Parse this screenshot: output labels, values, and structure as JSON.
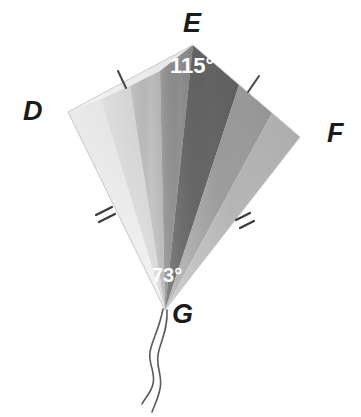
{
  "figure": {
    "background_color": "#ffffff",
    "vertices": [
      {
        "name": "D",
        "label": "D",
        "x": 68,
        "y": 112
      },
      {
        "name": "E",
        "label": "E",
        "x": 193,
        "y": 45
      },
      {
        "name": "F",
        "label": "F",
        "x": 300,
        "y": 137
      },
      {
        "name": "G",
        "label": "G",
        "x": 165,
        "y": 310
      }
    ],
    "angles": [
      {
        "name": "angle-at-E",
        "label": "115°",
        "value": 115,
        "at_vertex": "E",
        "text_color": "#ffffff"
      },
      {
        "name": "angle-at-G",
        "label": "73°",
        "value": 73,
        "at_vertex": "G",
        "text_color": "#ffffff"
      }
    ],
    "tick_marks": [
      {
        "name": "tick-DG",
        "segment": "DG",
        "count": 2,
        "color": "#3d3d3d"
      },
      {
        "name": "tick-FG",
        "segment": "FG",
        "count": 2,
        "color": "#3d3d3d"
      }
    ],
    "sectors": [
      {
        "name": "sector-1",
        "fill": "#f4f4f4"
      },
      {
        "name": "sector-2",
        "fill": "#e2e2e2"
      },
      {
        "name": "sector-3",
        "fill": "#cfcfcf"
      },
      {
        "name": "sector-4",
        "fill": "#9a9a9a"
      },
      {
        "name": "sector-5",
        "fill": "#6e6e6e"
      },
      {
        "name": "sector-6",
        "fill": "#a6a6a6"
      },
      {
        "name": "sector-7",
        "fill": "#bdbdbd"
      }
    ],
    "struts": [
      {
        "name": "strut-left",
        "color": "#4a4a4a"
      },
      {
        "name": "strut-right",
        "color": "#4a4a4a"
      }
    ],
    "tails": [
      {
        "name": "tail-string-left",
        "color": "#5a5a5a"
      },
      {
        "name": "tail-string-right",
        "color": "#5a5a5a"
      }
    ]
  }
}
